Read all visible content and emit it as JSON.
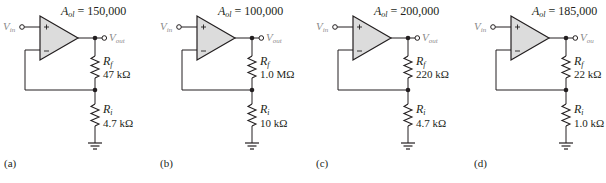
{
  "figure": {
    "panels": [
      {
        "label": "(a)",
        "gain_symbol": "A",
        "gain_sub": "ol",
        "gain_value": "= 150,000",
        "vin": {
          "main": "V",
          "sub": "in"
        },
        "vout": {
          "main": "V",
          "sub": "out"
        },
        "rf": {
          "main": "R",
          "sub": "f",
          "value": "47 kΩ"
        },
        "ri": {
          "main": "R",
          "sub": "i",
          "value": "4.7 kΩ"
        }
      },
      {
        "label": "(b)",
        "gain_symbol": "A",
        "gain_sub": "ol",
        "gain_value": "= 100,000",
        "vin": {
          "main": "V",
          "sub": "in"
        },
        "vout": {
          "main": "V",
          "sub": "out"
        },
        "rf": {
          "main": "R",
          "sub": "f",
          "value": "1.0 MΩ"
        },
        "ri": {
          "main": "R",
          "sub": "i",
          "value": "10 kΩ"
        }
      },
      {
        "label": "(c)",
        "gain_symbol": "A",
        "gain_sub": "ol",
        "gain_value": "= 200,000",
        "vin": {
          "main": "V",
          "sub": "in"
        },
        "vout": {
          "main": "V",
          "sub": "out"
        },
        "rf": {
          "main": "R",
          "sub": "f",
          "value": "220 kΩ"
        },
        "ri": {
          "main": "R",
          "sub": "i",
          "value": "4.7 kΩ"
        }
      },
      {
        "label": "(d)",
        "gain_symbol": "A",
        "gain_sub": "ol",
        "gain_value": "= 185,000",
        "vin": {
          "main": "V",
          "sub": "in"
        },
        "vout": {
          "main": "V",
          "sub": "ou"
        },
        "rf": {
          "main": "R",
          "sub": "f",
          "value": "22 kΩ"
        },
        "ri": {
          "main": "R",
          "sub": "i",
          "value": "1.0 kΩ"
        }
      }
    ],
    "colors": {
      "opamp_fill": "#dcdcdc",
      "wire": "#231f20",
      "terminal_label": "#8a8a8a"
    }
  }
}
